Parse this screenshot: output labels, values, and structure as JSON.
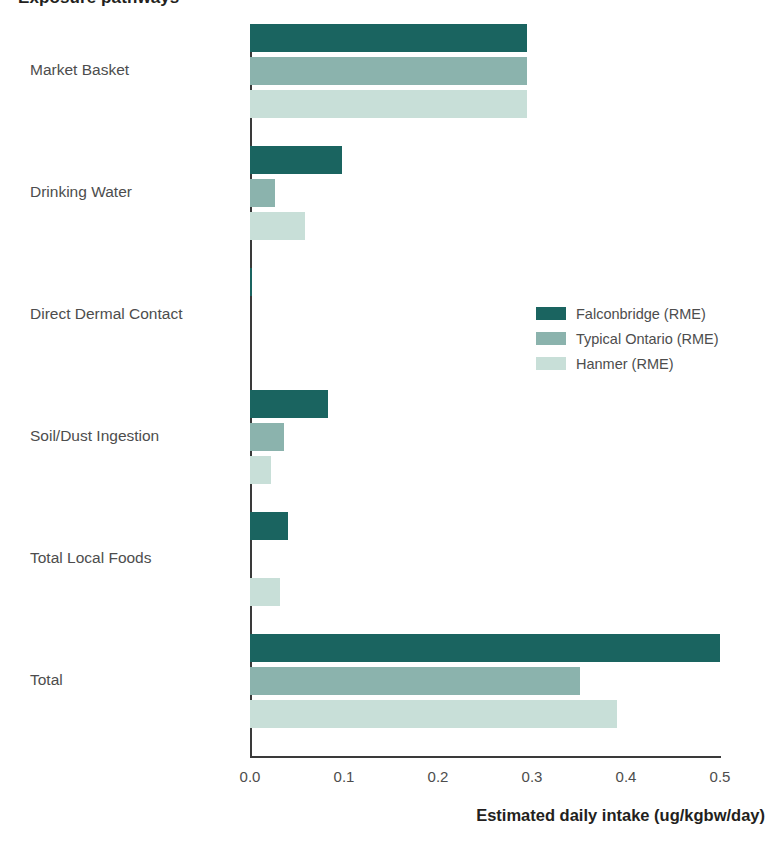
{
  "chart_data": {
    "type": "bar",
    "orientation": "horizontal",
    "title": "Exposure pathways",
    "xlabel": "Estimated daily intake (ug/kgbw/day)",
    "ylabel": "",
    "xlim": [
      0.0,
      0.5
    ],
    "xticks": [
      "0.0",
      "0.1",
      "0.2",
      "0.3",
      "0.4",
      "0.5"
    ],
    "xtick_values": [
      0.0,
      0.1,
      0.2,
      0.3,
      0.4,
      0.5
    ],
    "grid": false,
    "legend_position": "center-right",
    "categories": [
      "Market Basket",
      "Drinking Water",
      "Direct Dermal Contact",
      "Soil/Dust Ingestion",
      "Total Local Foods",
      "Total"
    ],
    "series": [
      {
        "name": "Falconbridge (RME)",
        "color": "#1a6460",
        "values": [
          0.295,
          0.098,
          0.002,
          0.083,
          0.04,
          0.5
        ]
      },
      {
        "name": "Typical Ontario (RME)",
        "color": "#8bb3ad",
        "values": [
          0.295,
          0.027,
          0.0,
          0.036,
          0.0,
          0.351
        ]
      },
      {
        "name": "Hanmer (RME)",
        "color": "#c8dfd8",
        "values": [
          0.295,
          0.058,
          0.0,
          0.022,
          0.032,
          0.39
        ]
      }
    ]
  },
  "axis": {
    "line_color": "#3a3a3a",
    "text_color": "#4d4d4d",
    "title_color": "#231f20"
  }
}
